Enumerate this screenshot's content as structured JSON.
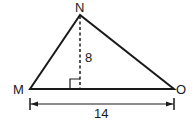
{
  "diagram": {
    "type": "triangle",
    "vertices": [
      {
        "label": "N",
        "x": 80,
        "y": 15
      },
      {
        "label": "M",
        "x": 30,
        "y": 89
      },
      {
        "label": "O",
        "x": 174,
        "y": 89
      }
    ],
    "height_label": "8",
    "base_label": "14",
    "colors": {
      "stroke": "#1a1a1a",
      "background": "#ffffff"
    }
  }
}
